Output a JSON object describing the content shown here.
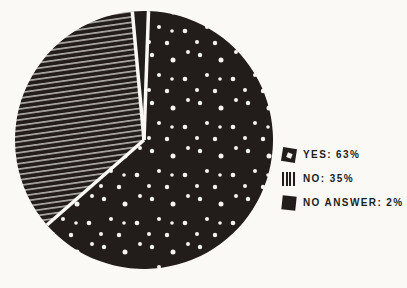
{
  "canvas": {
    "width": 407,
    "height": 288
  },
  "colors": {
    "ink": "#221d1b",
    "paper": "#faf9f6",
    "pattern_white": "#f5f3ef"
  },
  "chart_data": {
    "type": "pie",
    "title": "",
    "categories": [
      "YES",
      "NO",
      "NO ANSWER"
    ],
    "values": [
      63,
      35,
      2
    ],
    "unit": "%",
    "direction": "clockwise",
    "start_angle_deg": 2,
    "center": {
      "x": 144,
      "y": 140
    },
    "radius": 129,
    "separator_width": 3.5,
    "slices": [
      {
        "label": "YES",
        "value": 63,
        "pattern": "polka-dots"
      },
      {
        "label": "NO",
        "value": 35,
        "pattern": "diagonal-lines"
      },
      {
        "label": "NO ANSWER",
        "value": 2,
        "pattern": "solid"
      }
    ],
    "legend_position": "right",
    "grid": false
  },
  "legend": {
    "items": [
      {
        "label": "YES: 63%",
        "pattern": "polka-dot"
      },
      {
        "label": "NO: 35%",
        "pattern": "vertical-lines"
      },
      {
        "label": "NO ANSWER: 2%",
        "pattern": "solid"
      }
    ]
  }
}
